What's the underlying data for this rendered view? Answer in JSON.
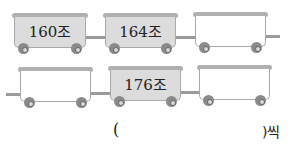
{
  "trains": [
    {
      "row": 1,
      "cars": [
        {
          "label": "160조",
          "filled": true
        },
        {
          "label": "164조",
          "filled": true
        },
        {
          "label": "",
          "filled": false
        }
      ]
    },
    {
      "row": 2,
      "cars": [
        {
          "label": "",
          "filled": false
        },
        {
          "label": "176조",
          "filled": true
        },
        {
          "label": "",
          "filled": false
        }
      ]
    }
  ],
  "answer": {
    "open_paren": "(",
    "close_suffix": ")씩"
  },
  "colors": {
    "filled_car": "#dcdcdc",
    "car_border": "#a9a9a9",
    "wheel": "#8a8a8a"
  }
}
